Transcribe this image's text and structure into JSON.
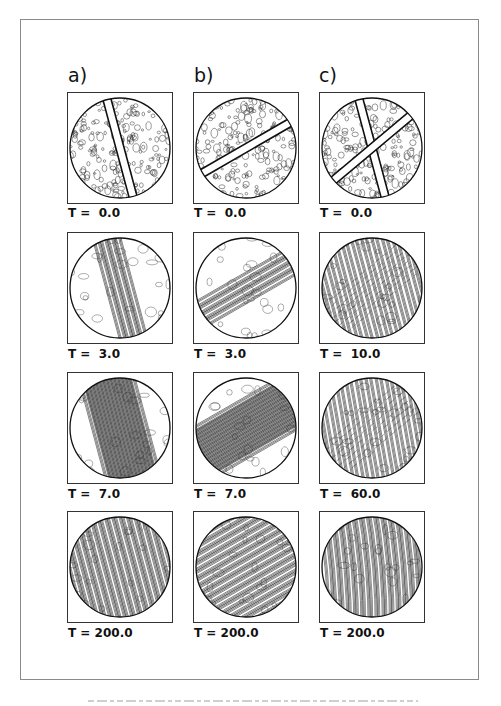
{
  "figure": {
    "columns": [
      {
        "label": "a)",
        "panels": [
          {
            "time_label": "T =  0.0",
            "pattern": "noise-with-stripe",
            "angle": 75
          },
          {
            "time_label": "T =  3.0",
            "pattern": "stripes-local",
            "angle": 75
          },
          {
            "time_label": "T =  7.0",
            "pattern": "stripes-spreading",
            "angle": 75
          },
          {
            "time_label": "T = 200.0",
            "pattern": "stripes-full",
            "angle": 75
          }
        ]
      },
      {
        "label": "b)",
        "panels": [
          {
            "time_label": "T =  0.0",
            "pattern": "noise-with-stripe",
            "angle": 150
          },
          {
            "time_label": "T =  3.0",
            "pattern": "stripes-local",
            "angle": 150
          },
          {
            "time_label": "T =  7.0",
            "pattern": "stripes-spreading",
            "angle": 150
          },
          {
            "time_label": "T = 200.0",
            "pattern": "stripes-full",
            "angle": 150
          }
        ]
      },
      {
        "label": "c)",
        "panels": [
          {
            "time_label": "T =  0.0",
            "pattern": "noise-with-cross",
            "angle": 75
          },
          {
            "time_label": "T =  10.0",
            "pattern": "cross-stripes",
            "angle": 75
          },
          {
            "time_label": "T =  60.0",
            "pattern": "cross-stripes",
            "angle": 80
          },
          {
            "time_label": "T = 200.0",
            "pattern": "stripes-full-wavy",
            "angle": 85
          }
        ]
      }
    ],
    "caption_visible": "illegible faint caption text at bottom"
  },
  "colors": {
    "border": "#8a8a8a",
    "contour": "#333333",
    "background": "#ffffff"
  }
}
